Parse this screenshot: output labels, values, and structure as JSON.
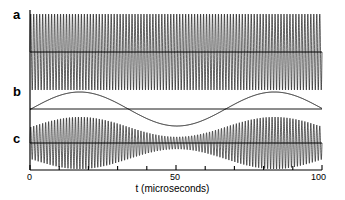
{
  "figure": {
    "background_color": "#ffffff",
    "line_color": "#000000",
    "axis_color": "#000000"
  },
  "axis": {
    "title": "t (microseconds)",
    "tick_values": [
      0,
      10,
      20,
      30,
      40,
      50,
      60,
      70,
      80,
      90,
      100
    ],
    "labeled_ticks": [
      {
        "value": 0,
        "label": "0"
      },
      {
        "value": 50,
        "label": "50"
      },
      {
        "value": 100,
        "label": "100"
      }
    ],
    "xmin": 0,
    "xmax": 100
  },
  "panels": [
    {
      "key": "a",
      "label": "a"
    },
    {
      "key": "b",
      "label": "b"
    },
    {
      "key": "c",
      "label": "c"
    }
  ],
  "chart_data": {
    "type": "line",
    "title": "",
    "xlabel": "t (microseconds)",
    "ylabel": "",
    "xlim": [
      0,
      100
    ],
    "grid": false,
    "legend": "none",
    "xticks": [
      0,
      10,
      20,
      30,
      40,
      50,
      60,
      70,
      80,
      90,
      100
    ],
    "xticklabels": [
      "0",
      "",
      "",
      "",
      "",
      "50",
      "",
      "",
      "",
      "",
      "100"
    ],
    "panel_annotations": [
      "a",
      "b",
      "c"
    ],
    "series": [
      {
        "name": "a",
        "description": "constant-amplitude carrier wave",
        "form": "A*sin(2*pi*f*t)",
        "amplitude": 1.0,
        "carrier_frequency_cycles_per_range": 98,
        "envelope": "constant",
        "ylim": [
          -1.15,
          1.15
        ]
      },
      {
        "name": "b",
        "description": "slow modulation waveform",
        "form": "M*cos(2*pi*fm*(t-t0))",
        "amplitude": 1.0,
        "modulation_frequency_cycles_per_range": 1.5,
        "peak_positions": [
          17,
          83
        ],
        "trough_positions": [
          50
        ],
        "ylim": [
          -1.6,
          1.6
        ]
      },
      {
        "name": "c",
        "description": "amplitude-modulated wave: carrier multiplied by modulation envelope",
        "form": "(1 + m*cos(2*pi*fm*(t-t0)))*sin(2*pi*f*t)",
        "amplitude": 1.0,
        "carrier_frequency_cycles_per_range": 98,
        "modulation_frequency_cycles_per_range": 1.5,
        "modulation_depth": 0.62,
        "envelope_peak_positions": [
          17,
          83
        ],
        "envelope_trough_positions": [
          50
        ],
        "ylim": [
          -1.15,
          1.15
        ]
      }
    ]
  }
}
